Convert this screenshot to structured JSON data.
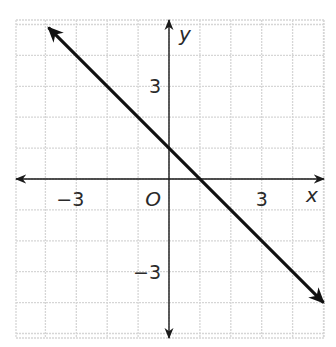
{
  "chart_data": {
    "type": "line",
    "title": "",
    "xlabel": "x",
    "ylabel": "y",
    "origin_label": "O",
    "xlim": [
      -5,
      5
    ],
    "ylim": [
      -5,
      5
    ],
    "grid": true,
    "grid_step": 1,
    "tick_labels": {
      "x": [
        {
          "value": -3,
          "label": "−3"
        },
        {
          "value": 3,
          "label": "3"
        }
      ],
      "y": [
        {
          "value": 3,
          "label": "3"
        },
        {
          "value": -3,
          "label": "−3"
        }
      ]
    },
    "series": [
      {
        "name": "line",
        "equation": "y = -x + 1",
        "slope": -1,
        "y_intercept": 1,
        "x_intercept": 1,
        "x": [
          -3.9,
          5
        ],
        "y": [
          4.9,
          -4
        ],
        "arrows_both_ends": true
      }
    ],
    "legend": null
  },
  "colors": {
    "grid": "#d6d6d6",
    "axes": "#1a1a1a",
    "line": "#111111",
    "text": "#2a2a2a"
  }
}
